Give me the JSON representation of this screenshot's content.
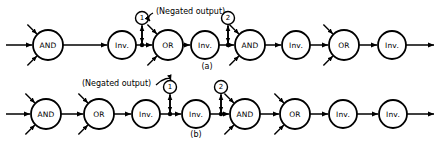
{
  "figure": {
    "ink_color": "#000000",
    "background": "#ffffff",
    "rows": [
      {
        "id": "a",
        "caption": "(a)",
        "nodes": [
          {
            "label": "AND",
            "cx": 48,
            "cy": 45,
            "r": 15,
            "stubs": [
              "up-left",
              "down-left"
            ]
          },
          {
            "label": "Inv.",
            "cx": 122,
            "cy": 45,
            "r": 14,
            "stubs": []
          },
          {
            "label": "OR",
            "cx": 168,
            "cy": 45,
            "r": 15,
            "stubs": [
              "up-left",
              "down-left"
            ]
          },
          {
            "label": "Inv.",
            "cx": 205,
            "cy": 45,
            "r": 14,
            "stubs": []
          },
          {
            "label": "AND",
            "cx": 250,
            "cy": 45,
            "r": 15,
            "stubs": [
              "up-left",
              "down-left"
            ]
          },
          {
            "label": "Inv.",
            "cx": 296,
            "cy": 45,
            "r": 14,
            "stubs": []
          },
          {
            "label": "OR",
            "cx": 344,
            "cy": 45,
            "r": 15,
            "stubs": [
              "up-left",
              "down-left"
            ]
          },
          {
            "label": "Inv.",
            "cx": 392,
            "cy": 45,
            "r": 14,
            "stubs": []
          }
        ],
        "markers": [
          {
            "text": "1",
            "cx": 142,
            "cy": 18,
            "r": 6.5,
            "tap_x": 142,
            "tap_y": 45
          },
          {
            "text": "2",
            "cx": 228,
            "cy": 18,
            "r": 6.5,
            "tap_x": 228,
            "tap_y": 45
          }
        ]
      },
      {
        "id": "b",
        "caption": "(b)",
        "nodes": [
          {
            "label": "AND",
            "cx": 46,
            "cy": 114,
            "r": 15,
            "stubs": [
              "up-left",
              "down-left"
            ]
          },
          {
            "label": "OR",
            "cx": 99,
            "cy": 114,
            "r": 15,
            "stubs": [
              "up-left",
              "down-left"
            ]
          },
          {
            "label": "Inv.",
            "cx": 146,
            "cy": 114,
            "r": 14,
            "stubs": []
          },
          {
            "label": "Inv.",
            "cx": 196,
            "cy": 114,
            "r": 14,
            "stubs": []
          },
          {
            "label": "AND",
            "cx": 245,
            "cy": 114,
            "r": 15,
            "stubs": [
              "up-left",
              "down-left"
            ]
          },
          {
            "label": "OR",
            "cx": 295,
            "cy": 114,
            "r": 15,
            "stubs": [
              "up-left",
              "down-left"
            ]
          },
          {
            "label": "Inv.",
            "cx": 343,
            "cy": 114,
            "r": 14,
            "stubs": []
          },
          {
            "label": "Inv.",
            "cx": 393,
            "cy": 114,
            "r": 14,
            "stubs": []
          }
        ],
        "markers": [
          {
            "text": "1",
            "cx": 170,
            "cy": 87,
            "r": 6.5,
            "tap_x": 170,
            "tap_y": 114
          },
          {
            "text": "2",
            "cx": 221,
            "cy": 87,
            "r": 6.5,
            "tap_x": 221,
            "tap_y": 114
          }
        ]
      }
    ],
    "annotations": [
      {
        "id": "negated-output-top",
        "text": "(Negated output)",
        "x": 156,
        "y": 11,
        "anchor": "start"
      },
      {
        "id": "negated-output-bottom",
        "text": "(Negated output)",
        "x": 82,
        "y": 83,
        "anchor": "start"
      }
    ],
    "captions": [
      {
        "id": "caption-a",
        "text": "(a)",
        "x": 207,
        "y": 66
      },
      {
        "id": "caption-b",
        "text": "(b)",
        "x": 196,
        "y": 134
      }
    ]
  }
}
